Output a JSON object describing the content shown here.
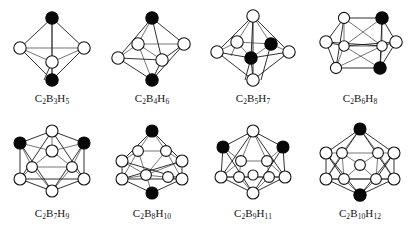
{
  "figure": {
    "background_color": "#ffffff",
    "vertex_open_color": "#ffffff",
    "vertex_filled_color": "#080808",
    "edge_color": "#1a1a1a",
    "columns": 4,
    "rows": 2
  },
  "legend": {
    "open_circle_meaning": "BH vertex",
    "filled_circle_meaning": "CH vertex"
  },
  "structures": [
    {
      "label_plain": "C2B3H5",
      "formula_parts": [
        {
          "element": "C",
          "count": "2"
        },
        {
          "element": "B",
          "count": "3"
        },
        {
          "element": "H",
          "count": "5"
        }
      ],
      "vertex_count": 5,
      "geometry": "trigonal bipyramid",
      "filled_vertices": 2,
      "open_vertices": 3
    },
    {
      "label_plain": "C2B4H6",
      "formula_parts": [
        {
          "element": "C",
          "count": "2"
        },
        {
          "element": "B",
          "count": "4"
        },
        {
          "element": "H",
          "count": "6"
        }
      ],
      "vertex_count": 6,
      "geometry": "octahedron",
      "filled_vertices": 2,
      "open_vertices": 4
    },
    {
      "label_plain": "C2B5H7",
      "formula_parts": [
        {
          "element": "C",
          "count": "2"
        },
        {
          "element": "B",
          "count": "5"
        },
        {
          "element": "H",
          "count": "7"
        }
      ],
      "vertex_count": 7,
      "geometry": "pentagonal bipyramid",
      "filled_vertices": 2,
      "open_vertices": 5
    },
    {
      "label_plain": "C2B6H8",
      "formula_parts": [
        {
          "element": "C",
          "count": "2"
        },
        {
          "element": "B",
          "count": "6"
        },
        {
          "element": "H",
          "count": "8"
        }
      ],
      "vertex_count": 8,
      "geometry": "dodecahedron",
      "filled_vertices": 2,
      "open_vertices": 6
    },
    {
      "label_plain": "C2B7H9",
      "formula_parts": [
        {
          "element": "C",
          "count": "2"
        },
        {
          "element": "B",
          "count": "7"
        },
        {
          "element": "H",
          "count": "9"
        }
      ],
      "vertex_count": 9,
      "geometry": "tricapped trigonal prism",
      "filled_vertices": 2,
      "open_vertices": 7
    },
    {
      "label_plain": "C2B8H10",
      "formula_parts": [
        {
          "element": "C",
          "count": "2"
        },
        {
          "element": "B",
          "count": "8"
        },
        {
          "element": "H",
          "count": "10"
        }
      ],
      "vertex_count": 10,
      "geometry": "bicapped square antiprism",
      "filled_vertices": 2,
      "open_vertices": 8
    },
    {
      "label_plain": "C2B9H11",
      "formula_parts": [
        {
          "element": "C",
          "count": "2"
        },
        {
          "element": "B",
          "count": "9"
        },
        {
          "element": "H",
          "count": "11"
        }
      ],
      "vertex_count": 11,
      "geometry": "edge-coalesced icosahedron",
      "filled_vertices": 2,
      "open_vertices": 9
    },
    {
      "label_plain": "C2B10H12",
      "formula_parts": [
        {
          "element": "C",
          "count": "2"
        },
        {
          "element": "B",
          "count": "10"
        },
        {
          "element": "H",
          "count": "12"
        }
      ],
      "vertex_count": 12,
      "geometry": "icosahedron",
      "filled_vertices": 2,
      "open_vertices": 10
    }
  ]
}
